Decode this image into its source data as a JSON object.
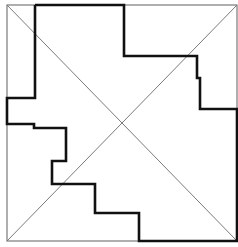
{
  "diagram": {
    "type": "geometric-dissection",
    "width": 238,
    "height": 247,
    "colors": {
      "background": "#ffffff",
      "thin_line": "#7a7a7a",
      "thick_line": "#111111"
    },
    "square": {
      "x1": 7,
      "y1": 5,
      "x2": 237,
      "y2": 241
    },
    "diagonals": [
      {
        "x1": 7,
        "y1": 5,
        "x2": 237,
        "y2": 241
      },
      {
        "x1": 237,
        "y1": 5,
        "x2": 7,
        "y2": 241
      }
    ],
    "thick_path_points": "35,5 124,5 124,56 197,56 197,78 200,78 200,109 237,109 237,241 139,241 139,213 95,213 95,184 52,184 52,161 66,161 66,128 34,128 34,124 7,124 7,98 35,98 35,5"
  }
}
